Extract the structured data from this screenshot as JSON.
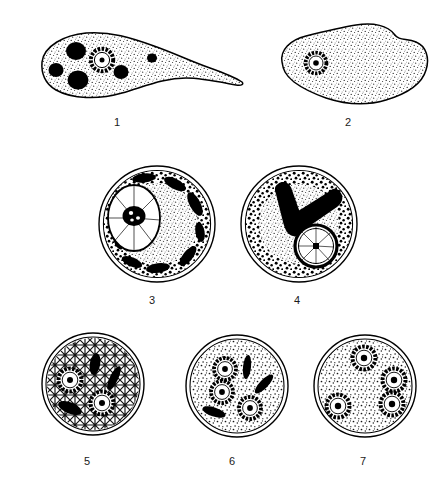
{
  "plate": {
    "title": "Entamoeba histolytica developmental stages",
    "background_color": "#ffffff",
    "ink_color": "#000000",
    "stipple_color": "#2b2b2b"
  },
  "figures": [
    {
      "number": "1",
      "name": "trophozoite-with-ingested-erythrocytes",
      "form": "trophozoite",
      "shape": "elongate amoeboid body with pointed pseudopod at right",
      "nuclei_count": 1,
      "nucleus_style": "ring with peripheral chromatin and central karyosome",
      "inclusions_count": 5,
      "inclusion_label": "ingested erythrocytes",
      "chromatoid_bars": 0,
      "cytoplasm_texture": "fine stipple",
      "wall": "single membrane",
      "caption_x": 117,
      "caption_y": 116
    },
    {
      "number": "2",
      "name": "uninucleate-precystic-form",
      "form": "precystic stage",
      "shape": "rounded lobed body",
      "nuclei_count": 1,
      "nucleus_style": "small ring with central karyosome",
      "inclusions_count": 0,
      "chromatoid_bars": 0,
      "cytoplasm_texture": "fine stipple",
      "wall": "single membrane",
      "caption_x": 348,
      "caption_y": 116
    },
    {
      "number": "3",
      "name": "young-cyst-with-large-nucleus-and-chromatoid-bodies",
      "form": "young uninucleate cyst",
      "shape": "spherical cyst",
      "nuclei_count": 1,
      "nucleus_style": "large oval nucleus with irregular karyosome and radiating achromatic fibrils",
      "inclusions_count": 0,
      "chromatoid_bars": 8,
      "cytoplasm_texture": "coarse peripheral granules",
      "wall": "double cyst wall",
      "caption_x": 152,
      "caption_y": 294
    },
    {
      "number": "4",
      "name": "uninucleate-cyst-with-large-chromatoid-bars",
      "form": "uninucleate cyst",
      "shape": "spherical cyst",
      "nuclei_count": 1,
      "nucleus_style": "nucleus with radiating fibrils and square karyosome",
      "inclusions_count": 0,
      "chromatoid_bars": 2,
      "chromatoid_note": "two large V-arranged rod-shaped bars",
      "cytoplasm_texture": "coarse peripheral granules",
      "wall": "double cyst wall",
      "caption_x": 297,
      "caption_y": 294
    },
    {
      "number": "5",
      "name": "binucleate-cyst",
      "form": "binucleate cyst",
      "shape": "spherical cyst",
      "nuclei_count": 2,
      "nucleus_style": "ring with peripheral chromatin and central karyosome",
      "inclusions_count": 0,
      "chromatoid_bars": 3,
      "cytoplasm_texture": "coarse reticular",
      "wall": "double cyst wall",
      "caption_x": 87,
      "caption_y": 455
    },
    {
      "number": "6",
      "name": "trinucleate-cyst",
      "form": "trinucleate cyst",
      "shape": "spherical cyst",
      "nuclei_count": 3,
      "nucleus_style": "ring with peripheral chromatin and central karyosome",
      "inclusions_count": 0,
      "chromatoid_bars": 4,
      "cytoplasm_texture": "fine stipple",
      "wall": "double cyst wall",
      "caption_x": 232,
      "caption_y": 455
    },
    {
      "number": "7",
      "name": "mature-quadrinucleate-cyst",
      "form": "mature quadrinucleate cyst",
      "shape": "spherical cyst",
      "nuclei_count": 4,
      "nucleus_style": "ring with peripheral chromatin and central karyosome",
      "inclusions_count": 0,
      "chromatoid_bars": 0,
      "cytoplasm_texture": "fine stipple",
      "wall": "double cyst wall",
      "caption_x": 363,
      "caption_y": 455
    }
  ]
}
